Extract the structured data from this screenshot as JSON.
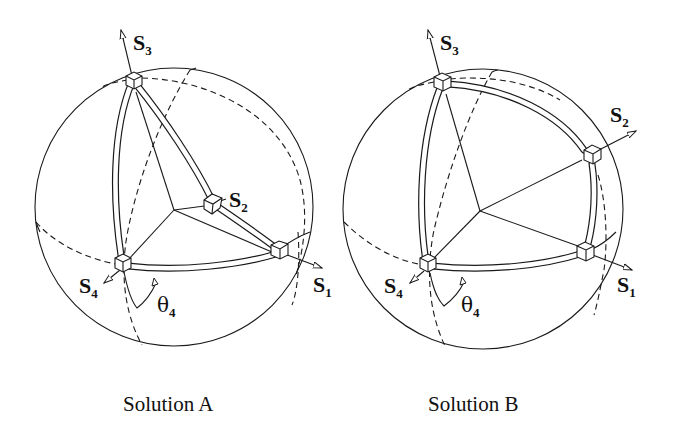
{
  "figures": [
    {
      "id": "A",
      "caption": "Solution A",
      "labels": {
        "s1": "S",
        "s1_sub": "1",
        "s2": "S",
        "s2_sub": "2",
        "s3": "S",
        "s3_sub": "3",
        "s4": "S",
        "s4_sub": "4",
        "theta": "θ",
        "theta_sub": "4"
      }
    },
    {
      "id": "B",
      "caption": "Solution B",
      "labels": {
        "s1": "S",
        "s1_sub": "1",
        "s2": "S",
        "s2_sub": "2",
        "s3": "S",
        "s3_sub": "3",
        "s4": "S",
        "s4_sub": "4",
        "theta": "θ",
        "theta_sub": "4"
      }
    }
  ]
}
